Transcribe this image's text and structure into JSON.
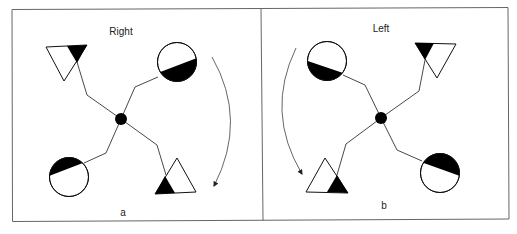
{
  "figure": {
    "colors": {
      "line": "#333333",
      "fill": "#000000",
      "frame": "#666666",
      "background": "#ffffff"
    },
    "panels": [
      {
        "id": "a",
        "title": "Right",
        "caption": "a",
        "rotation_direction": "clockwise",
        "arrow_icon": "curved-arrow-clockwise-icon",
        "center_node": "black-dot",
        "arms": [
          {
            "position": "top-left",
            "shape": "triangle",
            "orientation": "pointing-down",
            "filled_part": "top-right corner"
          },
          {
            "position": "top-right",
            "shape": "circle",
            "filled_part": "lower half (tilted)"
          },
          {
            "position": "bottom-left",
            "shape": "circle",
            "filled_part": "upper half (tilted)"
          },
          {
            "position": "bottom-right",
            "shape": "triangle",
            "orientation": "pointing-up",
            "filled_part": "bottom-left corner"
          }
        ]
      },
      {
        "id": "b",
        "title": "Left",
        "caption": "b",
        "rotation_direction": "counterclockwise",
        "arrow_icon": "curved-arrow-counterclockwise-icon",
        "center_node": "black-dot",
        "arms": [
          {
            "position": "top-left",
            "shape": "circle",
            "filled_part": "lower half (tilted)"
          },
          {
            "position": "top-right",
            "shape": "triangle",
            "orientation": "pointing-down",
            "filled_part": "top-left corner"
          },
          {
            "position": "bottom-left",
            "shape": "triangle",
            "orientation": "pointing-up",
            "filled_part": "bottom-right corner"
          },
          {
            "position": "bottom-right",
            "shape": "circle",
            "filled_part": "upper half (tilted)"
          }
        ]
      }
    ]
  }
}
